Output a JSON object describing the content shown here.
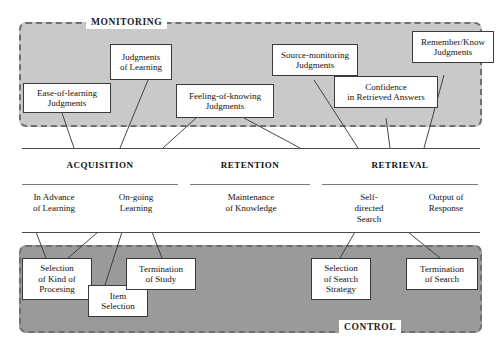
{
  "diagram": {
    "panels": {
      "monitoring": {
        "label": "MONITORING",
        "color": "#c9c9c9"
      },
      "control": {
        "label": "CONTROL",
        "color": "#9a9a9a"
      }
    },
    "phases": [
      {
        "name": "ACQUISITION"
      },
      {
        "name": "RETENTION"
      },
      {
        "name": "RETRIEVAL"
      }
    ],
    "stages": [
      {
        "label": "In Advance\nof Learning"
      },
      {
        "label": "On-going\nLearning"
      },
      {
        "label": "Maintenance\nof Knowledge"
      },
      {
        "label": "Self-\ndirected\nSearch"
      },
      {
        "label": "Output of\nResponse"
      }
    ],
    "monitoring_boxes": [
      {
        "label": "Ease-of-learning\nJudgments"
      },
      {
        "label": "Judgments\nof Learning"
      },
      {
        "label": "Feeling-of-knowing\nJudgments"
      },
      {
        "label": "Source-monitoring\nJudgments"
      },
      {
        "label": "Confidence\nin Retrieved Answers"
      },
      {
        "label": "Remember/Know\nJudgments"
      }
    ],
    "control_boxes": [
      {
        "label": "Selection\nof Kind of\nProcesing"
      },
      {
        "label": "Item\nSelection"
      },
      {
        "label": "Termination\nof Study"
      },
      {
        "label": "Selection\nof Search\nStrategy"
      },
      {
        "label": "Termination\nof Search"
      }
    ]
  }
}
